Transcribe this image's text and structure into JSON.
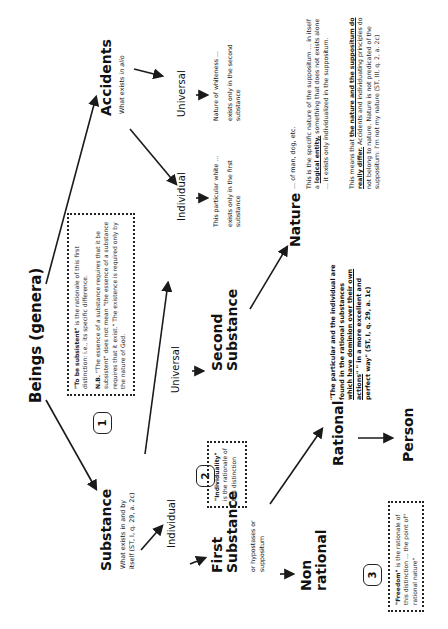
{
  "diagram": {
    "title": "Beings (genera)",
    "orientation": "rotated 90° counter-clockwise",
    "nodes": {
      "substance": {
        "label": "Substance",
        "desc_line1": "What exists in and by",
        "desc_line2": "itself (ST, I, q. 29, a. 2c)"
      },
      "accidents": {
        "label": "Accidents",
        "desc_prefix": "What exists ",
        "desc_italic": "in alio"
      },
      "substance_individual": {
        "label": "Individual"
      },
      "substance_universal": {
        "label": "Universal"
      },
      "accident_individual": {
        "label": "Individual",
        "desc_line1": "This particular white ...",
        "desc_line2": "exists only in the first",
        "desc_line3": "substance"
      },
      "accident_universal": {
        "label": "Universal",
        "desc_line1": "Nature of whiteness ...",
        "desc_line2": "exists only in the second",
        "desc_line3": "substance"
      },
      "first_substance": {
        "label_line1": "First",
        "label_line2": "Substance",
        "desc_line1": "or hypostases or",
        "desc_line2": "suppositum"
      },
      "second_substance": {
        "label_line1": "Second",
        "label_line2": "Substance"
      },
      "nature": {
        "label": "Nature",
        "desc_examples": "... of man, dog, etc.",
        "para1_a": "This is the specific nature of the suppositum ... in itself a ",
        "para1_b": "logical entity,",
        "para1_c": " something that does not exists alone ... it exists only individualized in the suppositum.",
        "para2_a": "This means that ",
        "para2_b": "the nature and the suppositum do really differ.",
        "para2_c": " Accidents and individuating principles do not belong to nature. Nature is not predicated of the suppositum: I'm not my nature (ST, III, q. 2, a. 2c)"
      },
      "non_rational": {
        "label_line1": "Non",
        "label_line2": "rational"
      },
      "rational": {
        "label": "Rational"
      },
      "person": {
        "label": "Person"
      }
    },
    "quote": {
      "a": "\"The particular and the individual are found in the rational substances ",
      "b": "which have dominion over their own actions",
      "c": "\" \" in a more excellent and perfect way\" (ST, I, q. 29, a. 1c)"
    },
    "notes": [
      {
        "badge": "1",
        "bold": "\"To be subsistent\"",
        "text": " is the rationale of this first distinction: i.e., its specific difference.",
        "nb_label": "N.B.",
        "nb_text": " \"The essence of a substance requires that it be subsistent\" does not mean \"the essence of a substance requires that it exist.\" The existence is required only by the nature of God."
      },
      {
        "badge": "2",
        "bold": "\"Individuality\"",
        "text": " is the rationale of this distinction"
      },
      {
        "badge": "3",
        "bold": "\"Freedom\"",
        "text": " is the rationale of this distinction ... the point of\" rational nature\""
      }
    ]
  },
  "colors": {
    "background": "#ffffff",
    "text": "#111111",
    "arrow": "#1a1a1a",
    "box_border": "#222222"
  }
}
